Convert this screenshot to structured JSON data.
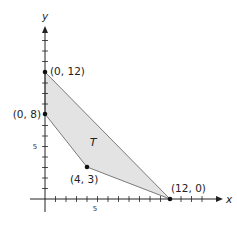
{
  "diagram": {
    "type": "feasible-region-graph",
    "axes": {
      "x_label": "x",
      "y_label": "y",
      "x_tick_label": "5",
      "y_tick_label": "5",
      "x_range": [
        0,
        16
      ],
      "y_range": [
        0,
        16
      ]
    },
    "region": {
      "label": "T",
      "fill": "#e3e3e3",
      "stroke": "#7a7a7a"
    },
    "vertices": [
      {
        "x": 0,
        "y": 12,
        "label": "(0, 12)"
      },
      {
        "x": 0,
        "y": 8,
        "label": "(0, 8)"
      },
      {
        "x": 4,
        "y": 3,
        "label": "(4, 3)"
      },
      {
        "x": 12,
        "y": 0,
        "label": "(12, 0)"
      }
    ]
  }
}
